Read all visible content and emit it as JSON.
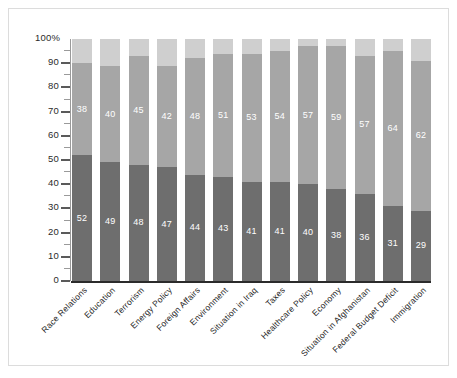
{
  "chart_data": {
    "type": "bar",
    "subtype": "stacked-bar-100",
    "title": "",
    "subtitle": "",
    "xlabel": "",
    "ylabel": "",
    "ylim": [
      0,
      100
    ],
    "yunit": "%",
    "grid": false,
    "legend_position": "none",
    "axis_top_label": "100%",
    "y_ticks": [
      0,
      10,
      20,
      30,
      40,
      50,
      60,
      70,
      80,
      90,
      100
    ],
    "y_tick_labels": [
      "0",
      "10",
      "20",
      "30",
      "40",
      "50",
      "60",
      "70",
      "80",
      "90",
      "100%"
    ],
    "y_minor_ticks": [
      5,
      15,
      25,
      35,
      45,
      55,
      65,
      75,
      85,
      95
    ],
    "categories": [
      "Race Relations",
      "Education",
      "Terrorism",
      "Energy Policy",
      "Foreign Affairs",
      "Environment",
      "Situation in Iraq",
      "Taxes",
      "Healthcare Policy",
      "Economy",
      "Situation in Afghanistan",
      "Federal Budget Deficit",
      "Immigration"
    ],
    "series": [
      {
        "name": "bottom-segment",
        "color": "#6e6e6e",
        "labels_shown": true,
        "values": [
          52,
          49,
          48,
          47,
          44,
          43,
          41,
          41,
          40,
          38,
          36,
          31,
          29
        ]
      },
      {
        "name": "middle-segment",
        "color": "#a6a6a6",
        "labels_shown": true,
        "values": [
          38,
          40,
          45,
          42,
          48,
          51,
          53,
          54,
          57,
          59,
          57,
          64,
          62
        ]
      },
      {
        "name": "top-segment",
        "color": "#cfcfcf",
        "labels_shown": false,
        "values": [
          10,
          11,
          7,
          11,
          8,
          6,
          6,
          5,
          3,
          3,
          7,
          5,
          9
        ]
      }
    ]
  },
  "colors": {
    "bottom": "#6e6e6e",
    "middle": "#a6a6a6",
    "top": "#cfcfcf",
    "axis": "#2b2b2b",
    "frame": "#dcdcdc",
    "background": "#ffffff",
    "value_label": "#ffffff"
  }
}
